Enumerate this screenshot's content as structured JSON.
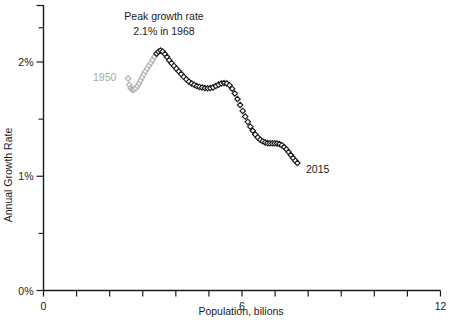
{
  "chart_data": {
    "type": "scatter",
    "title": "",
    "xlabel": "Population, bilions",
    "ylabel": "Annual Growth Rate",
    "xlim": [
      0,
      12
    ],
    "ylim": [
      0,
      2.3
    ],
    "grid": false,
    "legend": null,
    "x_ticklabels": [
      {
        "value": 0,
        "label": "0"
      },
      {
        "value": 6,
        "label": "6"
      },
      {
        "value": 12,
        "label": "12"
      }
    ],
    "x_tick_values": [
      0,
      1,
      2,
      3,
      4,
      5,
      6,
      7,
      8,
      9,
      10,
      11,
      12
    ],
    "y_ticklabels": [
      {
        "value": 0,
        "label": "0%"
      },
      {
        "value": 1,
        "label": "1%"
      },
      {
        "value": 2,
        "label": "2%"
      }
    ],
    "y_tick_values": [
      0,
      0.5,
      1,
      1.5,
      2,
      2.3
    ],
    "marker": "open-diamond",
    "series": [
      {
        "name": "early-gray",
        "color": "#b0b0b0",
        "points": [
          [
            2.556,
            1.855
          ],
          [
            2.594,
            1.8
          ],
          [
            2.632,
            1.772
          ],
          [
            2.672,
            1.76
          ],
          [
            2.712,
            1.758
          ],
          [
            2.754,
            1.762
          ],
          [
            2.797,
            1.772
          ],
          [
            2.841,
            1.79
          ],
          [
            2.886,
            1.812
          ],
          [
            2.933,
            1.838
          ],
          [
            2.981,
            1.866
          ],
          [
            3.03,
            1.892
          ],
          [
            3.081,
            1.918
          ],
          [
            3.133,
            1.944
          ],
          [
            3.186,
            1.968
          ],
          [
            3.241,
            1.992
          ],
          [
            3.297,
            2.018
          ],
          [
            3.355,
            2.046
          ]
        ]
      },
      {
        "name": "late-black",
        "color": "#1a1a1a",
        "points": [
          [
            3.414,
            2.072
          ],
          [
            3.475,
            2.09
          ],
          [
            3.537,
            2.1
          ],
          [
            3.601,
            2.092
          ],
          [
            3.667,
            2.07
          ],
          [
            3.734,
            2.044
          ],
          [
            3.802,
            2.016
          ],
          [
            3.872,
            1.99
          ],
          [
            3.943,
            1.966
          ],
          [
            4.016,
            1.942
          ],
          [
            4.09,
            1.918
          ],
          [
            4.165,
            1.894
          ],
          [
            4.241,
            1.87
          ],
          [
            4.318,
            1.848
          ],
          [
            4.396,
            1.828
          ],
          [
            4.475,
            1.812
          ],
          [
            4.554,
            1.8
          ],
          [
            4.634,
            1.79
          ],
          [
            4.715,
            1.782
          ],
          [
            4.796,
            1.776
          ],
          [
            4.878,
            1.772
          ],
          [
            4.96,
            1.77
          ],
          [
            5.043,
            1.772
          ],
          [
            5.126,
            1.778
          ],
          [
            5.209,
            1.79
          ],
          [
            5.292,
            1.802
          ],
          [
            5.375,
            1.812
          ],
          [
            5.458,
            1.816
          ],
          [
            5.54,
            1.812
          ],
          [
            5.622,
            1.796
          ],
          [
            5.703,
            1.766
          ],
          [
            5.784,
            1.724
          ],
          [
            5.864,
            1.676
          ],
          [
            5.943,
            1.624
          ],
          [
            6.021,
            1.572
          ],
          [
            6.098,
            1.522
          ],
          [
            6.175,
            1.476
          ],
          [
            6.251,
            1.434
          ],
          [
            6.327,
            1.398
          ],
          [
            6.402,
            1.366
          ],
          [
            6.477,
            1.34
          ],
          [
            6.551,
            1.32
          ],
          [
            6.625,
            1.306
          ],
          [
            6.699,
            1.296
          ],
          [
            6.772,
            1.29
          ],
          [
            6.845,
            1.288
          ],
          [
            6.917,
            1.288
          ],
          [
            6.989,
            1.288
          ],
          [
            7.061,
            1.286
          ],
          [
            7.132,
            1.282
          ],
          [
            7.202,
            1.272
          ],
          [
            7.272,
            1.256
          ],
          [
            7.341,
            1.236
          ],
          [
            7.409,
            1.212
          ],
          [
            7.476,
            1.186
          ],
          [
            7.543,
            1.16
          ],
          [
            7.609,
            1.136
          ],
          [
            7.674,
            1.116
          ]
        ]
      }
    ],
    "annotations": [
      {
        "name": "peak-annotation",
        "lines": [
          "Peak growth rate",
          "2.1% in 1968"
        ],
        "color": "#1a1a1a"
      },
      {
        "name": "start-year-label",
        "text": "1950",
        "color": "#a8a8a8"
      },
      {
        "name": "end-year-label",
        "text": "2015",
        "color": "#1a1a1a"
      }
    ]
  },
  "labels": {
    "peak_line1": "Peak growth rate",
    "peak_line2": "2.1% in 1968",
    "year_start": "1950",
    "year_end": "2015",
    "x_axis_title": "Population, bilions",
    "y_axis_title": "Annual Growth Rate",
    "x_tick_0": "0",
    "x_tick_6": "6",
    "x_tick_12": "12",
    "y_tick_0": "0%",
    "y_tick_1": "1%",
    "y_tick_2": "2%"
  }
}
